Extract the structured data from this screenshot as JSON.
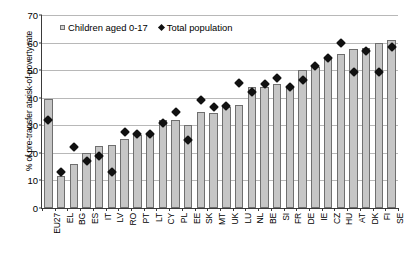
{
  "chart_data": {
    "type": "bar",
    "title": "",
    "xlabel": "",
    "ylabel": "% of pre-transfer at-risk-of-poverty rate",
    "ylim": [
      0,
      70
    ],
    "yticks": [
      0,
      10,
      20,
      30,
      40,
      50,
      60,
      70
    ],
    "grid": true,
    "legend_position": "top-left",
    "categories": [
      "EU27",
      "EL",
      "BG",
      "ES",
      "IT",
      "LV",
      "RO",
      "PT",
      "LT",
      "CY",
      "PL",
      "EE",
      "SK",
      "MT",
      "UK",
      "LU",
      "NL",
      "BE",
      "SI",
      "FR",
      "DE",
      "IE",
      "CZ",
      "HU",
      "AT",
      "DK",
      "FI",
      "SE"
    ],
    "series": [
      {
        "name": "Children aged 0-17",
        "type": "bar",
        "values": [
          39.5,
          11.5,
          16,
          20,
          22.5,
          23,
          25,
          26.5,
          27,
          32,
          32,
          30,
          35,
          34.5,
          36.5,
          37.5,
          44,
          44,
          45,
          44,
          50,
          51,
          54,
          56,
          57.5,
          58,
          60,
          61
        ]
      },
      {
        "name": "Total population",
        "type": "scatter-diamond",
        "values": [
          32,
          13,
          22,
          17,
          19,
          13,
          27.5,
          27,
          27,
          31,
          35,
          24.5,
          39,
          36.5,
          37,
          45.5,
          42,
          45,
          47,
          44,
          46.5,
          51.5,
          54.5,
          60,
          49.5,
          57,
          49.5,
          58.5
        ]
      }
    ]
  },
  "legend": {
    "items": [
      {
        "label": "Children aged 0-17",
        "marker": "square"
      },
      {
        "label": "Total population",
        "marker": "diamond"
      }
    ]
  },
  "colors": {
    "bar_fill": "#c6c6c6",
    "bar_stroke": "#6f6f6f",
    "marker": "#111111",
    "gridline": "#b8b8b8",
    "axis": "#3a3a3a",
    "background": "#ffffff"
  }
}
